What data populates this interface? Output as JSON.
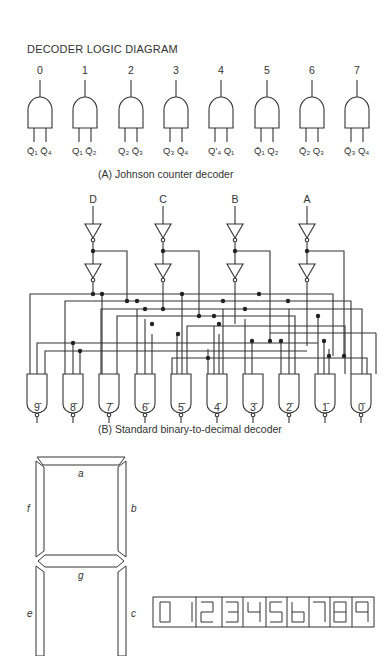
{
  "title": "DECODER LOGIC DIAGRAM",
  "johnson": {
    "caption": "(A)  Johnson counter decoder",
    "gates": [
      {
        "output": "0",
        "in1": "Q̄₁",
        "in2": "Q̄₄"
      },
      {
        "output": "1",
        "in1": "Q₁",
        "in2": "Q̄₂"
      },
      {
        "output": "2",
        "in1": "Q₂",
        "in2": "Q̄₃"
      },
      {
        "output": "3",
        "in1": "Q₃",
        "in2": "Q̄₄"
      },
      {
        "output": "4",
        "in1": "Q'₄",
        "in2": "Q₁"
      },
      {
        "output": "5",
        "in1": "Q̄₁",
        "in2": "Q₂"
      },
      {
        "output": "6",
        "in1": "Q̄₂",
        "in2": "Q₃"
      },
      {
        "output": "7",
        "in1": "Q̄₃",
        "in2": "Q₄"
      }
    ]
  },
  "standard": {
    "caption": "(B)  Standard binary-to-decimal decoder",
    "inputs": [
      "D",
      "C",
      "B",
      "A"
    ],
    "outputs": [
      "9̄",
      "8̄",
      "7̄",
      "6̄",
      "5̄",
      "4̄",
      "3̄",
      "2̄",
      "1̄",
      "0̄"
    ]
  },
  "seven_segment": {
    "segments": {
      "a": "a",
      "b": "b",
      "c": "c",
      "d": "d",
      "e": "e",
      "f": "f",
      "g": "g"
    },
    "display_digits": [
      "0",
      "1",
      "2",
      "3",
      "4",
      "5",
      "6",
      "7",
      "8",
      "9"
    ]
  }
}
